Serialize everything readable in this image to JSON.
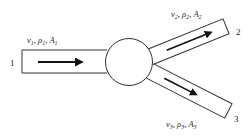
{
  "diagram": {
    "type": "flow-junction",
    "junction": {
      "shape": "circle"
    },
    "pipes": [
      {
        "id": "1",
        "label": "1",
        "role": "inlet",
        "props": {
          "v": "v",
          "rho": "ρ",
          "A": "A",
          "sub": "1"
        },
        "flow_direction": "right"
      },
      {
        "id": "2",
        "label": "2",
        "role": "outlet",
        "props": {
          "v": "v",
          "rho": "ρ",
          "A": "A",
          "sub": "2"
        },
        "flow_direction": "up-right"
      },
      {
        "id": "3",
        "label": "3",
        "role": "outlet",
        "props": {
          "v": "v",
          "rho": "ρ",
          "A": "A",
          "sub": "3"
        },
        "flow_direction": "down-right"
      }
    ],
    "colors": {
      "stroke": "#222222",
      "background": "#ffffff"
    }
  }
}
